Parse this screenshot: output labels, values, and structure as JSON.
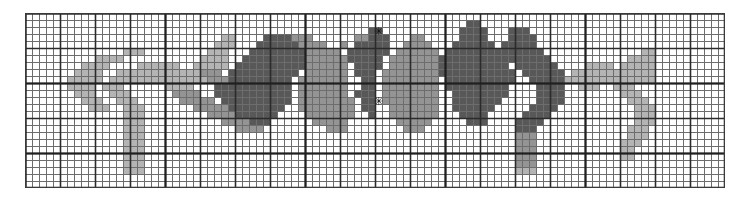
{
  "figure": {
    "width_px": 741,
    "height_px": 200,
    "background_color": "#ffffff"
  },
  "grid": {
    "origin_x_px": 25,
    "origin_y_px": 13,
    "cell_size_px": 7,
    "cols": 100,
    "rows": 25,
    "minor_line_color": "#6d6d6d",
    "major_line_color": "#2b2b2b",
    "major_every": 5,
    "major_every_heavy": 20,
    "minor_line_width_px": 1,
    "major_line_width_px": 1.6,
    "border_color": "#3a3a3a",
    "show_grid": true
  },
  "palette": {
    "white": "#ffffff",
    "light_gray": "#b4b4b4",
    "mid_gray": "#949494",
    "dark_gray": "#585858",
    "black": "#111111",
    "levels": [
      {
        "key": "0",
        "label": "empty",
        "color": "#ffffff"
      },
      {
        "key": "1",
        "label": "light",
        "color": "#b4b4b4"
      },
      {
        "key": "2",
        "label": "medium",
        "color": "#949494"
      },
      {
        "key": "3",
        "label": "dark",
        "color": "#585858"
      }
    ]
  },
  "markers": [
    {
      "name": "marker-top-center",
      "glyph": "✳",
      "col": 50,
      "row": 2
    },
    {
      "name": "marker-body-center",
      "glyph": "✳",
      "col": 50,
      "row": 12
    }
  ],
  "chart_data": {
    "type": "heatmap",
    "xlabel": "",
    "ylabel": "",
    "cols": 100,
    "rows": 25,
    "value_levels": [
      0,
      1,
      2,
      3
    ],
    "level_colors": [
      "#ffffff",
      "#b4b4b4",
      "#949494",
      "#585858"
    ],
    "grid": true,
    "legend": "none",
    "xlim": [
      0,
      100
    ],
    "ylim": [
      0,
      25
    ],
    "pixels": [
      "0000000000000000000000000000000000000000000000000000000000000000000000000000000000000000000000000000",
      "0000000000000000000000000000000000000000000000000000000000000000000000000000000000000000000000000000",
      "0000000000000000000000000000000000000000000000000000000000000000000000000000000000000000000000000000",
      "0000000000000000000000000000000000000000000000000000000000000000000000000000000000000000000000000000",
      "0000000000000000000000000000000000000000000000000333000000000000000000000000000000000000000000000000",
      "0000000000000000000000000000000000000000000002223333330000003330003000000000000000000000000000000000",
      "0000000000000000000000000000000000000000000022233333333000033333033300000000000000000000000000000000",
      "0000000000000000000000000000000000000000000222222233333333333333333330000000000000000000000000000000",
      "0000000000000000000000000000000000000002222222221133333033333333333333322000000000000000000000000000",
      "0000000000000000000000000000000000222222222222211333330333333333332222222220000000000000000000000000",
      "0000000000000000000000000000011222222222222222113333333333330222222222233322200000000000000000000000",
      "0000000000000000000000001111111222222222222221133333333333022222222222233333330000000000000000000000",
      "0000000000000000000111111111111112222222222211133333333002222222222222233333333000000000000000000000",
      "0000000000000001111111111111111111222222222211133330330022222222222222233333333300000000000000000000",
      "0000000000001111111111111111111111122222222211133300033022222222222222223333333330000000000000000000",
      "0000000000111111111111111111111111112222222211333000033022222222222222222333333333000000000000000000",
      "0000000011111111111111111111111111111222222211330000003022222222222222222233333333300000000000000000",
      "0000001111111111111111111111111111111122222113300000000302222222222222222223333333330000000000000000",
      "0000011111111111111111111111111111111112221133000000000030222222222222222222333333333000000000000000",
      "0000111111111111111111111111111111111111111330000000000003022222222222222222233333333300000000000000",
      "0001111111111111111111111111111111111111113300000000000000302222222222222222223333333330000000000000",
      "0011111111111111111111111111111111111111133000000000000000030222222222222222222333333333000000000000",
      "0111111111111111111111111111111111111111330000000000000000003022222222222222222233333333300000000000",
      "0000000000000000000000000000000000000000000000000000000000000000000000000000000000000000000000000000",
      "0000000000000000000000000000000000000000000000000000000000000000000000000000000000000000000000000000"
    ],
    "regions": [
      {
        "name": "left-leg-upper",
        "note": "light gray arc sweeping left and down"
      },
      {
        "name": "left-leg-lower",
        "note": "light gray vertical descender"
      },
      {
        "name": "body-left-dark",
        "note": "dark gray mass left of center"
      },
      {
        "name": "body-center",
        "note": "medium gray body block with white eye spots"
      },
      {
        "name": "body-right-dark",
        "note": "dark gray mass right of center"
      },
      {
        "name": "right-leg-upper",
        "note": "light gray arc sweeping right"
      },
      {
        "name": "right-leg-lower",
        "note": "light gray vertical descender"
      }
    ]
  },
  "sprite": {
    "note": "Explicit run-length pixel map actually rendered, one entry per filled cell run.",
    "runs": [
      {
        "row": 1,
        "col": 63,
        "len": 2,
        "v": 3
      },
      {
        "row": 2,
        "col": 49,
        "len": 1,
        "v": 3
      },
      {
        "row": 2,
        "col": 50,
        "len": 1,
        "v": 3
      },
      {
        "row": 2,
        "col": 62,
        "len": 4,
        "v": 3
      },
      {
        "row": 2,
        "col": 69,
        "len": 3,
        "v": 3
      },
      {
        "row": 3,
        "col": 28,
        "len": 2,
        "v": 1
      },
      {
        "row": 3,
        "col": 34,
        "len": 4,
        "v": 3
      },
      {
        "row": 3,
        "col": 38,
        "len": 3,
        "v": 2
      },
      {
        "row": 3,
        "col": 47,
        "len": 2,
        "v": 2
      },
      {
        "row": 3,
        "col": 49,
        "len": 3,
        "v": 3
      },
      {
        "row": 3,
        "col": 55,
        "len": 2,
        "v": 2
      },
      {
        "row": 3,
        "col": 62,
        "len": 4,
        "v": 3
      },
      {
        "row": 3,
        "col": 69,
        "len": 4,
        "v": 3
      },
      {
        "row": 4,
        "col": 27,
        "len": 3,
        "v": 1
      },
      {
        "row": 4,
        "col": 33,
        "len": 6,
        "v": 3
      },
      {
        "row": 4,
        "col": 39,
        "len": 4,
        "v": 2
      },
      {
        "row": 4,
        "col": 45,
        "len": 1,
        "v": 2
      },
      {
        "row": 4,
        "col": 47,
        "len": 5,
        "v": 3
      },
      {
        "row": 4,
        "col": 54,
        "len": 4,
        "v": 2
      },
      {
        "row": 4,
        "col": 61,
        "len": 6,
        "v": 3
      },
      {
        "row": 4,
        "col": 68,
        "len": 5,
        "v": 3
      },
      {
        "row": 5,
        "col": 14,
        "len": 3,
        "v": 1
      },
      {
        "row": 5,
        "col": 26,
        "len": 3,
        "v": 1
      },
      {
        "row": 5,
        "col": 32,
        "len": 8,
        "v": 3
      },
      {
        "row": 5,
        "col": 40,
        "len": 5,
        "v": 2
      },
      {
        "row": 5,
        "col": 46,
        "len": 6,
        "v": 3
      },
      {
        "row": 5,
        "col": 53,
        "len": 6,
        "v": 2
      },
      {
        "row": 5,
        "col": 60,
        "len": 8,
        "v": 3
      },
      {
        "row": 5,
        "col": 68,
        "len": 6,
        "v": 3
      },
      {
        "row": 5,
        "col": 88,
        "len": 2,
        "v": 1
      },
      {
        "row": 6,
        "col": 10,
        "len": 4,
        "v": 1
      },
      {
        "row": 6,
        "col": 25,
        "len": 4,
        "v": 1
      },
      {
        "row": 6,
        "col": 31,
        "len": 9,
        "v": 3
      },
      {
        "row": 6,
        "col": 40,
        "len": 6,
        "v": 2
      },
      {
        "row": 6,
        "col": 46,
        "len": 5,
        "v": 3
      },
      {
        "row": 6,
        "col": 52,
        "len": 7,
        "v": 2
      },
      {
        "row": 6,
        "col": 59,
        "len": 9,
        "v": 3
      },
      {
        "row": 6,
        "col": 68,
        "len": 7,
        "v": 3
      },
      {
        "row": 6,
        "col": 86,
        "len": 4,
        "v": 1
      },
      {
        "row": 7,
        "col": 8,
        "len": 4,
        "v": 1
      },
      {
        "row": 7,
        "col": 16,
        "len": 6,
        "v": 1
      },
      {
        "row": 7,
        "col": 24,
        "len": 5,
        "v": 1
      },
      {
        "row": 7,
        "col": 30,
        "len": 10,
        "v": 3
      },
      {
        "row": 7,
        "col": 40,
        "len": 6,
        "v": 2
      },
      {
        "row": 7,
        "col": 47,
        "len": 4,
        "v": 3
      },
      {
        "row": 7,
        "col": 52,
        "len": 7,
        "v": 2
      },
      {
        "row": 7,
        "col": 59,
        "len": 10,
        "v": 3
      },
      {
        "row": 7,
        "col": 70,
        "len": 6,
        "v": 3
      },
      {
        "row": 7,
        "col": 80,
        "len": 4,
        "v": 1
      },
      {
        "row": 7,
        "col": 85,
        "len": 5,
        "v": 1
      },
      {
        "row": 8,
        "col": 7,
        "len": 4,
        "v": 1
      },
      {
        "row": 8,
        "col": 13,
        "len": 12,
        "v": 1
      },
      {
        "row": 8,
        "col": 25,
        "len": 3,
        "v": 2
      },
      {
        "row": 8,
        "col": 29,
        "len": 10,
        "v": 3
      },
      {
        "row": 8,
        "col": 40,
        "len": 6,
        "v": 2
      },
      {
        "row": 8,
        "col": 47,
        "len": 3,
        "v": 3
      },
      {
        "row": 8,
        "col": 51,
        "len": 8,
        "v": 2
      },
      {
        "row": 8,
        "col": 59,
        "len": 11,
        "v": 3
      },
      {
        "row": 8,
        "col": 71,
        "len": 6,
        "v": 3
      },
      {
        "row": 8,
        "col": 78,
        "len": 12,
        "v": 1
      },
      {
        "row": 9,
        "col": 6,
        "len": 5,
        "v": 1
      },
      {
        "row": 9,
        "col": 12,
        "len": 14,
        "v": 1
      },
      {
        "row": 9,
        "col": 26,
        "len": 3,
        "v": 2
      },
      {
        "row": 9,
        "col": 29,
        "len": 9,
        "v": 3
      },
      {
        "row": 9,
        "col": 39,
        "len": 7,
        "v": 2
      },
      {
        "row": 9,
        "col": 48,
        "len": 2,
        "v": 3
      },
      {
        "row": 9,
        "col": 51,
        "len": 8,
        "v": 2
      },
      {
        "row": 9,
        "col": 60,
        "len": 10,
        "v": 3
      },
      {
        "row": 9,
        "col": 72,
        "len": 5,
        "v": 3
      },
      {
        "row": 9,
        "col": 77,
        "len": 13,
        "v": 1
      },
      {
        "row": 10,
        "col": 6,
        "len": 4,
        "v": 1
      },
      {
        "row": 10,
        "col": 11,
        "len": 3,
        "v": 1
      },
      {
        "row": 10,
        "col": 20,
        "len": 4,
        "v": 1
      },
      {
        "row": 10,
        "col": 27,
        "len": 3,
        "v": 3
      },
      {
        "row": 10,
        "col": 30,
        "len": 8,
        "v": 3
      },
      {
        "row": 10,
        "col": 39,
        "len": 7,
        "v": 2
      },
      {
        "row": 10,
        "col": 48,
        "len": 2,
        "v": 3
      },
      {
        "row": 10,
        "col": 51,
        "len": 8,
        "v": 2
      },
      {
        "row": 10,
        "col": 60,
        "len": 9,
        "v": 3
      },
      {
        "row": 10,
        "col": 73,
        "len": 4,
        "v": 3
      },
      {
        "row": 10,
        "col": 79,
        "len": 3,
        "v": 1
      },
      {
        "row": 10,
        "col": 84,
        "len": 3,
        "v": 1
      },
      {
        "row": 11,
        "col": 7,
        "len": 3,
        "v": 1
      },
      {
        "row": 11,
        "col": 12,
        "len": 3,
        "v": 1
      },
      {
        "row": 11,
        "col": 21,
        "len": 4,
        "v": 2
      },
      {
        "row": 11,
        "col": 27,
        "len": 11,
        "v": 3
      },
      {
        "row": 11,
        "col": 39,
        "len": 7,
        "v": 2
      },
      {
        "row": 11,
        "col": 47,
        "len": 3,
        "v": 3
      },
      {
        "row": 11,
        "col": 51,
        "len": 8,
        "v": 2
      },
      {
        "row": 11,
        "col": 61,
        "len": 8,
        "v": 3
      },
      {
        "row": 11,
        "col": 73,
        "len": 4,
        "v": 3
      },
      {
        "row": 11,
        "col": 85,
        "len": 3,
        "v": 1
      },
      {
        "row": 12,
        "col": 8,
        "len": 3,
        "v": 1
      },
      {
        "row": 12,
        "col": 13,
        "len": 3,
        "v": 1
      },
      {
        "row": 12,
        "col": 22,
        "len": 5,
        "v": 2
      },
      {
        "row": 12,
        "col": 28,
        "len": 10,
        "v": 3
      },
      {
        "row": 12,
        "col": 39,
        "len": 8,
        "v": 2
      },
      {
        "row": 12,
        "col": 48,
        "len": 2,
        "v": 3
      },
      {
        "row": 12,
        "col": 51,
        "len": 8,
        "v": 2
      },
      {
        "row": 12,
        "col": 61,
        "len": 7,
        "v": 3
      },
      {
        "row": 12,
        "col": 73,
        "len": 4,
        "v": 3
      },
      {
        "row": 12,
        "col": 86,
        "len": 3,
        "v": 1
      },
      {
        "row": 13,
        "col": 9,
        "len": 3,
        "v": 1
      },
      {
        "row": 13,
        "col": 14,
        "len": 3,
        "v": 1
      },
      {
        "row": 13,
        "col": 24,
        "len": 5,
        "v": 2
      },
      {
        "row": 13,
        "col": 29,
        "len": 8,
        "v": 3
      },
      {
        "row": 13,
        "col": 39,
        "len": 8,
        "v": 2
      },
      {
        "row": 13,
        "col": 48,
        "len": 2,
        "v": 3
      },
      {
        "row": 13,
        "col": 52,
        "len": 7,
        "v": 2
      },
      {
        "row": 13,
        "col": 61,
        "len": 6,
        "v": 3
      },
      {
        "row": 13,
        "col": 72,
        "len": 4,
        "v": 3
      },
      {
        "row": 13,
        "col": 87,
        "len": 3,
        "v": 1
      },
      {
        "row": 14,
        "col": 14,
        "len": 3,
        "v": 1
      },
      {
        "row": 14,
        "col": 26,
        "len": 4,
        "v": 2
      },
      {
        "row": 14,
        "col": 30,
        "len": 6,
        "v": 3
      },
      {
        "row": 14,
        "col": 40,
        "len": 7,
        "v": 2
      },
      {
        "row": 14,
        "col": 49,
        "len": 1,
        "v": 3
      },
      {
        "row": 14,
        "col": 52,
        "len": 7,
        "v": 2
      },
      {
        "row": 14,
        "col": 62,
        "len": 4,
        "v": 3
      },
      {
        "row": 14,
        "col": 71,
        "len": 4,
        "v": 3
      },
      {
        "row": 14,
        "col": 87,
        "len": 3,
        "v": 1
      },
      {
        "row": 15,
        "col": 14,
        "len": 3,
        "v": 1
      },
      {
        "row": 15,
        "col": 28,
        "len": 4,
        "v": 2
      },
      {
        "row": 15,
        "col": 32,
        "len": 3,
        "v": 3
      },
      {
        "row": 15,
        "col": 41,
        "len": 5,
        "v": 2
      },
      {
        "row": 15,
        "col": 53,
        "len": 5,
        "v": 2
      },
      {
        "row": 15,
        "col": 63,
        "len": 3,
        "v": 3
      },
      {
        "row": 15,
        "col": 70,
        "len": 4,
        "v": 3
      },
      {
        "row": 15,
        "col": 87,
        "len": 3,
        "v": 1
      },
      {
        "row": 16,
        "col": 14,
        "len": 3,
        "v": 1
      },
      {
        "row": 16,
        "col": 30,
        "len": 4,
        "v": 2
      },
      {
        "row": 16,
        "col": 43,
        "len": 3,
        "v": 2
      },
      {
        "row": 16,
        "col": 54,
        "len": 3,
        "v": 2
      },
      {
        "row": 16,
        "col": 70,
        "len": 3,
        "v": 3
      },
      {
        "row": 16,
        "col": 86,
        "len": 3,
        "v": 1
      },
      {
        "row": 17,
        "col": 14,
        "len": 3,
        "v": 1
      },
      {
        "row": 17,
        "col": 70,
        "len": 3,
        "v": 2
      },
      {
        "row": 17,
        "col": 86,
        "len": 3,
        "v": 1
      },
      {
        "row": 18,
        "col": 14,
        "len": 3,
        "v": 1
      },
      {
        "row": 18,
        "col": 70,
        "len": 3,
        "v": 2
      },
      {
        "row": 18,
        "col": 85,
        "len": 3,
        "v": 1
      },
      {
        "row": 19,
        "col": 14,
        "len": 3,
        "v": 1
      },
      {
        "row": 19,
        "col": 70,
        "len": 3,
        "v": 2
      },
      {
        "row": 19,
        "col": 85,
        "len": 2,
        "v": 1
      },
      {
        "row": 20,
        "col": 14,
        "len": 3,
        "v": 1
      },
      {
        "row": 20,
        "col": 70,
        "len": 3,
        "v": 2
      },
      {
        "row": 20,
        "col": 85,
        "len": 2,
        "v": 1
      },
      {
        "row": 21,
        "col": 14,
        "len": 3,
        "v": 1
      },
      {
        "row": 21,
        "col": 70,
        "len": 3,
        "v": 2
      },
      {
        "row": 22,
        "col": 14,
        "len": 3,
        "v": 1
      },
      {
        "row": 22,
        "col": 70,
        "len": 3,
        "v": 1
      }
    ]
  }
}
